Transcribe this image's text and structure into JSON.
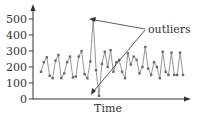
{
  "chart_data": {
    "type": "line",
    "title": "",
    "xlabel": "Time",
    "ylabel": "",
    "ylim": [
      0,
      550
    ],
    "yticks": [
      0,
      100,
      200,
      300,
      400,
      500
    ],
    "ytick_labels": [
      "0",
      "100",
      "200",
      "300",
      "400",
      "500"
    ],
    "grid": false,
    "legend": null,
    "annotations": [
      {
        "text": "outliers",
        "points_to": [
          18,
          20
        ],
        "comment": "arrows point to the spike (~500) and the dip (~20)"
      }
    ],
    "series": [
      {
        "name": "series",
        "x": [
          0,
          1,
          2,
          3,
          4,
          5,
          6,
          7,
          8,
          9,
          10,
          11,
          12,
          13,
          14,
          15,
          16,
          17,
          18,
          19,
          20,
          21,
          22,
          23,
          24,
          25,
          26,
          27,
          28,
          29,
          30,
          31,
          32,
          33,
          34,
          35,
          36,
          37,
          38,
          39,
          40,
          41,
          42,
          43,
          44,
          45,
          46,
          47,
          48,
          49
        ],
        "values": [
          170,
          230,
          260,
          145,
          130,
          240,
          275,
          130,
          160,
          230,
          265,
          135,
          140,
          265,
          300,
          155,
          130,
          235,
          500,
          180,
          20,
          220,
          295,
          200,
          305,
          170,
          230,
          245,
          170,
          130,
          285,
          215,
          265,
          245,
          160,
          200,
          325,
          190,
          150,
          230,
          200,
          130,
          295,
          170,
          150,
          290,
          150,
          150,
          290,
          150
        ]
      }
    ],
    "style": {
      "line_color": "#8a8a8a",
      "marker_color": "#6a6a6a",
      "axis_color": "#333333"
    }
  }
}
